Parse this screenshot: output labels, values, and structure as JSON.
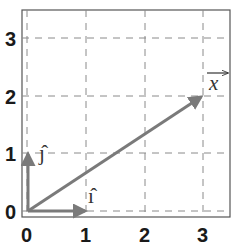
{
  "diagram": {
    "type": "vector-plot",
    "x_ticks": [
      "0",
      "1",
      "2",
      "3"
    ],
    "y_ticks": [
      "0",
      "1",
      "2",
      "3"
    ],
    "xlim": [
      -0.1,
      3.45
    ],
    "ylim": [
      -0.1,
      3.45
    ],
    "grid": "dashed",
    "vectors": [
      {
        "name": "i-hat",
        "label": "ı̂",
        "from": [
          0,
          0
        ],
        "to": [
          1,
          0
        ]
      },
      {
        "name": "j-hat",
        "label": "ȷ̂",
        "from": [
          0,
          0
        ],
        "to": [
          0,
          1
        ]
      },
      {
        "name": "x-vector",
        "label": "x",
        "from": [
          0,
          0
        ],
        "to": [
          3,
          2
        ]
      }
    ],
    "colors": {
      "vector": "#7a7a7a",
      "grid": "#8a8a8a",
      "frame": "#555555",
      "text": "#1a1a1a"
    }
  }
}
